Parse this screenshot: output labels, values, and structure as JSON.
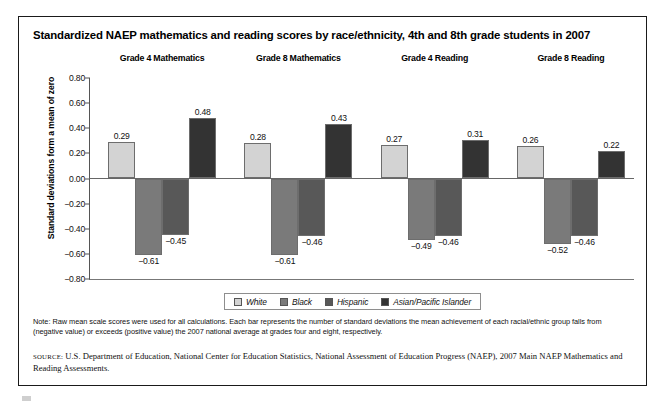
{
  "figure": {
    "title": "Standardized NAEP mathematics and reading scores by race/ethnicity, 4th and 8th grade students in 2007",
    "note": "Note: Raw mean scale scores were used for all calculations. Each bar represents the number of standard deviations the mean achievement of each racial/ethnic group falls from (negative value) or exceeds (positive value) the 2007 national average at grades four and eight, respectively.",
    "source_kicker": "SOURCE:",
    "source": " U.S. Department of Education, National Center for Education Statistics, National Assessment of Education Progress (NAEP), 2007 Main NAEP Mathematics and Reading Assessments."
  },
  "chart_data": {
    "type": "bar",
    "title": "Standardized NAEP mathematics and reading scores by race/ethnicity, 4th and 8th grade students in 2007",
    "xlabel": "",
    "ylabel": "Standard deviations form a mean of zero",
    "ylim": [
      -0.8,
      0.8
    ],
    "ytick_labels": [
      "0.80",
      "0.60",
      "0.40",
      "0.20",
      "0.00",
      "−0.20",
      "−0.40",
      "−0.60",
      "−0.80"
    ],
    "ytick_values": [
      0.8,
      0.6,
      0.4,
      0.2,
      0.0,
      -0.2,
      -0.4,
      -0.6,
      -0.8
    ],
    "grid": false,
    "legend_position": "bottom",
    "categories": [
      "Grade 4 Mathematics",
      "Grade 8 Mathematics",
      "Grade 4 Reading",
      "Grade 8 Reading"
    ],
    "series": [
      {
        "name": "White",
        "color": "#d3d3d3",
        "values": [
          0.29,
          0.28,
          0.27,
          0.26
        ],
        "labels": [
          "0.29",
          "0.28",
          "0.27",
          "0.26"
        ]
      },
      {
        "name": "Black",
        "color": "#7a7a7a",
        "values": [
          -0.61,
          -0.61,
          -0.49,
          -0.52
        ],
        "labels": [
          "−0.61",
          "−0.61",
          "−0.49",
          "−0.52"
        ]
      },
      {
        "name": "Hispanic",
        "color": "#585858",
        "values": [
          -0.45,
          -0.46,
          -0.46,
          -0.46
        ],
        "labels": [
          "−0.45",
          "−0.46",
          "−0.46",
          "−0.46"
        ]
      },
      {
        "name": "Asian/Pacific Islander",
        "color": "#333333",
        "values": [
          0.48,
          0.43,
          0.31,
          0.22
        ],
        "labels": [
          "0.48",
          "0.43",
          "0.31",
          "0.22"
        ]
      }
    ]
  }
}
